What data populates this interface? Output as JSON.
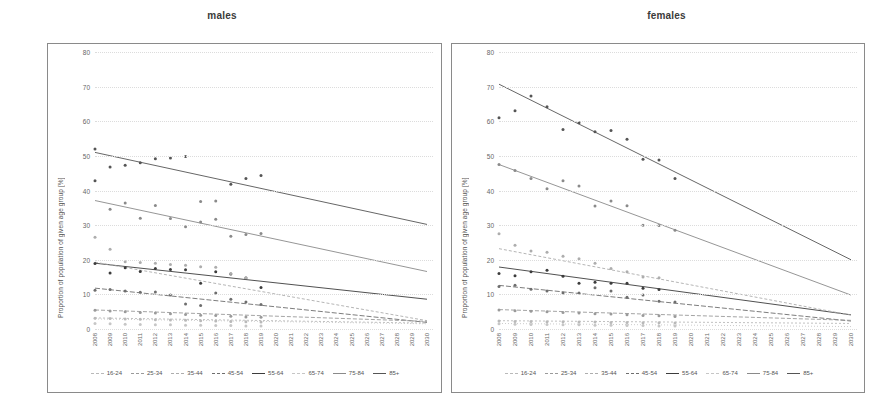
{
  "figure": {
    "panels": [
      {
        "id": "males",
        "title": "males"
      },
      {
        "id": "females",
        "title": "females"
      }
    ],
    "ylabel": "Proportion of population of given age group [%]",
    "yticks": [
      "0",
      "10",
      "20",
      "30",
      "40",
      "50",
      "60",
      "70",
      "80"
    ],
    "xticks": [
      "2008",
      "2009",
      "2010",
      "2011",
      "2012",
      "2013",
      "2014",
      "2015",
      "2016",
      "2017",
      "2018",
      "2019",
      "2020",
      "2021",
      "2022",
      "2023",
      "2024",
      "2025",
      "2026",
      "2027",
      "2028",
      "2029",
      "2030"
    ],
    "legend": [
      {
        "label": "16-24",
        "color": "#b9b9b9",
        "dash": "2,2"
      },
      {
        "label": "25-34",
        "color": "#9a9a9a",
        "dash": "4,2"
      },
      {
        "label": "35-44",
        "color": "#adadad",
        "dash": "3,2"
      },
      {
        "label": "45-54",
        "color": "#6e6e6e",
        "dash": "5,2"
      },
      {
        "label": "55-64",
        "color": "#3c3c3c",
        "dash": "0"
      },
      {
        "label": "65-74",
        "color": "#c6c6c6",
        "dash": "1,2"
      },
      {
        "label": "75-84",
        "color": "#8a8a8a",
        "dash": "0"
      },
      {
        "label": "85+",
        "color": "#555555",
        "dash": "0"
      }
    ]
  },
  "chart_data": [
    {
      "type": "scatter",
      "title": "males",
      "xlabel": "",
      "ylabel": "Proportion of population of given age group [%]",
      "xlim": [
        2008,
        2030
      ],
      "ylim": [
        0,
        80
      ],
      "grid": true,
      "legend_position": "bottom",
      "x": [
        2008,
        2009,
        2010,
        2011,
        2012,
        2013,
        2014,
        2015,
        2016,
        2017,
        2018,
        2019
      ],
      "series": [
        {
          "name": "85+",
          "color": "#555555",
          "values": [
            52.0,
            46.8,
            47.3,
            48.0,
            49.2,
            49.4,
            49.8,
            null,
            null,
            41.8,
            43.5,
            44.3
          ],
          "extra_points": [
            [
              2008,
              42.8
            ]
          ],
          "trend": {
            "start_year": 2008,
            "start_value": 51.0,
            "end_year": 2030,
            "end_value": 30.2
          }
        },
        {
          "name": "75-84",
          "color": "#8a8a8a",
          "values": [
            null,
            34.6,
            36.4,
            32.0,
            35.7,
            31.9,
            29.5,
            36.8,
            37.0,
            26.8,
            27.3,
            27.6
          ],
          "extra_points": [
            [
              2015,
              30.9
            ],
            [
              2016,
              31.7
            ]
          ],
          "trend": {
            "start_year": 2008,
            "start_value": 37.1,
            "end_year": 2030,
            "end_value": 16.6
          }
        },
        {
          "name": "55-64",
          "color": "#3c3c3c",
          "values": [
            18.9,
            16.2,
            17.7,
            16.6,
            17.5,
            17.2,
            17.1,
            13.2,
            16.5,
            15.9,
            14.7,
            12.0
          ],
          "extra_points": [],
          "trend": {
            "start_year": 2008,
            "start_value": 19.0,
            "end_year": 2030,
            "end_value": 8.6
          }
        },
        {
          "name": "45-54",
          "color": "#6e6e6e",
          "values": [
            11.2,
            11.4,
            11.0,
            10.6,
            10.7,
            9.8,
            7.2,
            6.8,
            10.4,
            8.6,
            7.8,
            7.1
          ],
          "extra_points": [],
          "trend": {
            "start_year": 2008,
            "start_value": 11.8,
            "end_year": 2030,
            "end_value": 1.9
          }
        },
        {
          "name": "35-44",
          "color": "#adadad",
          "values": [
            26.5,
            23.0,
            19.4,
            19.2,
            19.0,
            18.6,
            18.4,
            18.0,
            17.8,
            16.0,
            14.8,
            null
          ],
          "extra_points": [],
          "trend": {
            "start_year": 2008,
            "start_value": 19.3,
            "end_year": 2030,
            "end_value": 2.4
          }
        },
        {
          "name": "25-34",
          "color": "#9a9a9a",
          "values": [
            5.4,
            5.2,
            5.0,
            4.8,
            4.6,
            4.4,
            4.2,
            4.0,
            3.9,
            3.7,
            3.5,
            3.4
          ],
          "extra_points": [],
          "trend": {
            "start_year": 2008,
            "start_value": 5.5,
            "end_year": 2030,
            "end_value": 2.2
          }
        },
        {
          "name": "16-24",
          "color": "#b9b9b9",
          "values": [
            3.1,
            3.0,
            2.9,
            2.8,
            2.7,
            2.6,
            2.5,
            2.4,
            2.3,
            2.2,
            2.1,
            2.0
          ],
          "extra_points": [],
          "trend": {
            "start_year": 2008,
            "start_value": 3.2,
            "end_year": 2030,
            "end_value": 1.7
          }
        },
        {
          "name": "65-74",
          "color": "#c6c6c6",
          "values": [
            1.6,
            1.5,
            1.4,
            1.3,
            1.2,
            1.2,
            1.1,
            1.1,
            1.0,
            1.0,
            0.9,
            0.9
          ],
          "extra_points": [],
          "trend": {
            "start_year": 2008,
            "start_value": 2.9,
            "end_year": 2030,
            "end_value": 1.5
          }
        }
      ]
    },
    {
      "type": "scatter",
      "title": "females",
      "xlabel": "",
      "ylabel": "Proportion of population of given age group [%]",
      "xlim": [
        2008,
        2030
      ],
      "ylim": [
        0,
        80
      ],
      "grid": true,
      "legend_position": "bottom",
      "x": [
        2008,
        2009,
        2010,
        2011,
        2012,
        2013,
        2014,
        2015,
        2016,
        2017,
        2018,
        2019
      ],
      "series": [
        {
          "name": "85+",
          "color": "#555555",
          "values": [
            61.0,
            63.0,
            67.3,
            64.2,
            57.6,
            59.6,
            57.0,
            57.3,
            54.8,
            49.0,
            48.8,
            43.5
          ],
          "extra_points": [],
          "trend": {
            "start_year": 2008,
            "start_value": 70.7,
            "end_year": 2030,
            "end_value": 20.0
          }
        },
        {
          "name": "75-84",
          "color": "#8a8a8a",
          "values": [
            47.5,
            45.8,
            43.5,
            40.5,
            42.8,
            41.3,
            35.5,
            37.0,
            35.6,
            30.0,
            29.9,
            28.5
          ],
          "extra_points": [],
          "trend": {
            "start_year": 2008,
            "start_value": 47.5,
            "end_year": 2030,
            "end_value": 9.8
          }
        },
        {
          "name": "55-64",
          "color": "#3c3c3c",
          "values": [
            16.0,
            15.4,
            16.5,
            17.0,
            15.2,
            13.2,
            13.5,
            13.2,
            13.2,
            11.8,
            11.4,
            null
          ],
          "extra_points": [],
          "trend": {
            "start_year": 2008,
            "start_value": 17.9,
            "end_year": 2030,
            "end_value": 4.1
          }
        },
        {
          "name": "45-54",
          "color": "#6e6e6e",
          "values": [
            12.3,
            12.6,
            11.5,
            11.0,
            10.4,
            10.4,
            11.9,
            11.0,
            9.2,
            9.8,
            8.0,
            7.8
          ],
          "extra_points": [],
          "trend": {
            "start_year": 2008,
            "start_value": 12.6,
            "end_year": 2030,
            "end_value": 2.3
          }
        },
        {
          "name": "35-44",
          "color": "#adadad",
          "values": [
            27.5,
            24.2,
            22.5,
            22.2,
            21.0,
            20.3,
            19.0,
            17.5,
            16.5,
            15.0,
            14.8,
            null
          ],
          "extra_points": [],
          "trend": {
            "start_year": 2008,
            "start_value": 23.2,
            "end_year": 2030,
            "end_value": 4.0
          }
        },
        {
          "name": "25-34",
          "color": "#9a9a9a",
          "values": [
            5.5,
            5.3,
            5.1,
            5.0,
            4.8,
            4.6,
            4.4,
            4.3,
            4.1,
            3.9,
            3.8,
            3.6
          ],
          "extra_points": [],
          "trend": {
            "start_year": 2008,
            "start_value": 5.6,
            "end_year": 2030,
            "end_value": 2.5
          }
        },
        {
          "name": "16-24",
          "color": "#b9b9b9",
          "values": [
            2.3,
            2.2,
            2.2,
            2.1,
            2.1,
            2.0,
            2.0,
            1.9,
            1.9,
            1.8,
            1.8,
            1.7
          ],
          "extra_points": [],
          "trend": {
            "start_year": 2008,
            "start_value": 2.4,
            "end_year": 2030,
            "end_value": 1.6
          }
        },
        {
          "name": "65-74",
          "color": "#c6c6c6",
          "values": [
            1.5,
            1.4,
            1.3,
            1.3,
            1.2,
            1.2,
            1.1,
            1.1,
            1.0,
            1.0,
            0.9,
            0.9
          ],
          "extra_points": [],
          "trend": {
            "start_year": 2008,
            "start_value": 1.6,
            "end_year": 2030,
            "end_value": 0.7
          }
        }
      ]
    }
  ]
}
